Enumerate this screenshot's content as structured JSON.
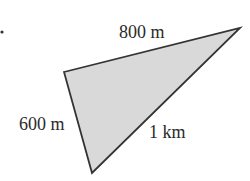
{
  "diagram": {
    "type": "triangle",
    "fill_color": "#d9d9d9",
    "stroke_color": "#333333",
    "vertices": {
      "left": [
        64,
        72
      ],
      "top_right": [
        240,
        28
      ],
      "bottom": [
        92,
        173
      ]
    },
    "sides": [
      {
        "id": "top",
        "label": "800 m",
        "from": "left",
        "to": "top_right"
      },
      {
        "id": "left",
        "label": "600 m",
        "from": "left",
        "to": "bottom"
      },
      {
        "id": "hypotenuse",
        "label": "1 km",
        "from": "bottom",
        "to": "top_right"
      }
    ],
    "bullet_marker": "•"
  }
}
